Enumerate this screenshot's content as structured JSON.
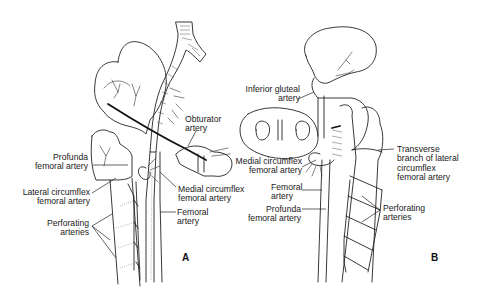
{
  "figure": {
    "panels": [
      {
        "id": "A",
        "letter": "A",
        "labels": {
          "obturator": [
            "Obturator",
            "artery"
          ],
          "profunda": [
            "Profunda",
            "femoral artery"
          ],
          "lateral_circumflex": [
            "Lateral circumflex",
            "femoral artery"
          ],
          "medial_circumflex": [
            "Medial circumflex",
            "femoral artery"
          ],
          "femoral": [
            "Femoral",
            "artery"
          ],
          "perforating": [
            "Perforating",
            "arteries"
          ]
        }
      },
      {
        "id": "B",
        "letter": "B",
        "labels": {
          "inferior_gluteal": [
            "Inferior gluteal",
            "artery"
          ],
          "medial_circumflex": [
            "Medial circumflex",
            "femoral artery"
          ],
          "transverse_branch": [
            "Transverse",
            "branch of lateral",
            "circumflex",
            "femoral artery"
          ],
          "femoral": [
            "Femoral",
            "artery"
          ],
          "profunda": [
            "Profunda",
            "femoral artery"
          ],
          "perforating": [
            "Perforating",
            "arteries"
          ]
        }
      }
    ]
  }
}
